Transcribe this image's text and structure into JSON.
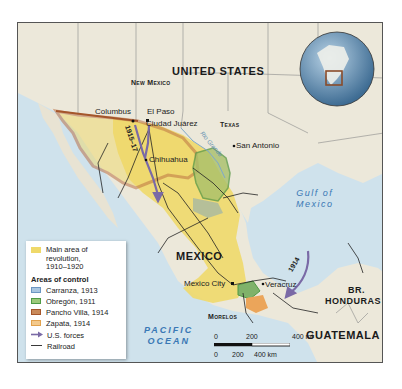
{
  "map": {
    "title": "Mexican Revolution areas of control, 1910-1920",
    "labels": {
      "countries": {
        "united_states": "UNITED STATES",
        "mexico": "MEXICO",
        "guatemala": "GUATEMALA",
        "br_honduras_line1": "BR.",
        "br_honduras_line2": "HONDURAS"
      },
      "states": {
        "new_mexico": "New Mexico",
        "texas": "Texas",
        "morelos": "Morelos"
      },
      "cities": {
        "columbus": "Columbus",
        "el_paso": "El Paso",
        "ciudad_juarez": "Ciudad Juárez",
        "san_antonio": "San Antonio",
        "chihuahua": "Chihuahua",
        "mexico_city": "Mexico City",
        "veracruz": "Veracruz"
      },
      "water": {
        "gulf_line1": "Gulf of",
        "gulf_line2": "Mexico",
        "pacific_line1": "PACIFIC",
        "pacific_line2": "OCEAN",
        "rio_grande": "Rio Grande"
      },
      "routes": {
        "pershing_expedition": "1915–17",
        "veracruz_occupation": "1914"
      }
    },
    "legend": {
      "main_area": "Main area of revolution, 1910–1920",
      "main_area_line1": "Main area of",
      "main_area_line2": "revolution,",
      "main_area_line3": "1910–1920",
      "areas_header": "Areas of control",
      "items": [
        {
          "label": "Carranza, 1913",
          "color": "#a9c6e0",
          "border": "#6d97c2"
        },
        {
          "label": "Obregón, 1911",
          "color": "#9cc97a",
          "border": "#4f9a45"
        },
        {
          "label": "Pancho Villa, 1914",
          "color": "#c98a5a",
          "border": "#a4562b"
        },
        {
          "label": "Zapata, 1914",
          "color": "#f3c98c",
          "border": "#e2a24d"
        }
      ],
      "us_forces": "U.S. forces",
      "railroad": "Railroad"
    },
    "scale": {
      "mi_labels": [
        "0",
        "200",
        "400 mi"
      ],
      "km_labels": [
        "0",
        "200",
        "400 km"
      ]
    },
    "colors": {
      "land": "#ece8da",
      "water": "#cfe2ec",
      "revolution": "#efd96a",
      "villa": "#b8683a",
      "obregon": "#7fb26a",
      "zapata": "#eba55a",
      "us_forces": "#7a6aa6",
      "inset_box": "#8a4b2a"
    }
  }
}
